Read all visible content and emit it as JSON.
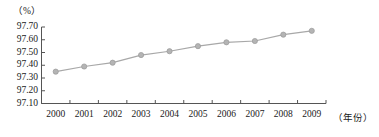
{
  "chart_data": {
    "type": "line",
    "title": "",
    "subtitle": "",
    "unit_label": "（%）",
    "xlabel": "（年份）",
    "ylabel": "",
    "categories": [
      "2000",
      "2001",
      "2002",
      "2003",
      "2004",
      "2005",
      "2006",
      "2007",
      "2008",
      "2009"
    ],
    "values": [
      97.35,
      97.39,
      97.42,
      97.48,
      97.51,
      97.55,
      97.58,
      97.59,
      97.64,
      97.67
    ],
    "series": [
      {
        "name": "",
        "values": [
          97.35,
          97.39,
          97.42,
          97.48,
          97.51,
          97.55,
          97.58,
          97.59,
          97.64,
          97.67
        ]
      }
    ],
    "ylim": [
      97.1,
      97.7
    ],
    "ytick_labels": [
      "97.70",
      "97.60",
      "97.50",
      "97.40",
      "97.30",
      "97.20",
      "97.10"
    ],
    "ytick_values": [
      97.7,
      97.6,
      97.5,
      97.4,
      97.3,
      97.2,
      97.1
    ],
    "grid": false,
    "legend": false,
    "legend_position": "none",
    "marker": "circle",
    "colors": {
      "line": "#a8a8a8",
      "marker_fill": "#b4b4b4",
      "marker_stroke": "#999999",
      "axis": "#555555",
      "text": "#1a1a1a",
      "background": "#ffffff"
    }
  }
}
